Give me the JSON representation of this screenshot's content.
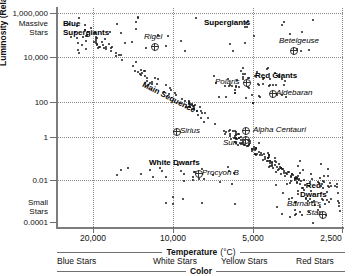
{
  "chart_data": {
    "type": "scatter",
    "title": "",
    "xlabel": "Temperature (°C)",
    "ylabel": "Luminosity (Relative to the Sun)",
    "x_scale": "log-reversed",
    "y_scale": "log",
    "xticks": [
      "20,000",
      "10,000",
      "5,000",
      "2,500"
    ],
    "xtick_values": [
      20000,
      10000,
      5000,
      2500
    ],
    "yticks": [
      "1,000,000",
      "10,000",
      "100",
      "1",
      "0.01",
      "0.0001"
    ],
    "ytick_values": [
      1000000,
      10000,
      100,
      1,
      0.01,
      0.0001
    ],
    "grid": "dotted",
    "y_extreme_top_note": "Massive Stars",
    "y_extreme_bottom_note": "Small Stars",
    "color_axis_label": "Color",
    "color_categories": [
      "Blue Stars",
      "White Stars",
      "Yellow Stars",
      "Red Stars"
    ],
    "region_labels": [
      {
        "name": "blue-supergiants",
        "text": "Blue\nSupergiants"
      },
      {
        "name": "supergiants",
        "text": "Supergiants"
      },
      {
        "name": "main-sequence",
        "text": "Main Sequence"
      },
      {
        "name": "red-giants",
        "text": "Red Giants"
      },
      {
        "name": "white-dwarfs",
        "text": "White Dwarfs"
      },
      {
        "name": "red-dwarfs",
        "text": "Red\nDwarfs"
      }
    ],
    "named_stars": [
      {
        "name": "Rigel",
        "temperature": 11000,
        "luminosity": 40000
      },
      {
        "name": "Betelgeuse",
        "temperature": 3400,
        "luminosity": 12000
      },
      {
        "name": "Polaris",
        "temperature": 6000,
        "luminosity": 2200
      },
      {
        "name": "Aldebaran",
        "temperature": 3900,
        "luminosity": 400
      },
      {
        "name": "Sirius",
        "temperature": 9900,
        "luminosity": 25
      },
      {
        "name": "Alpha Centauri",
        "temperature": 5500,
        "luminosity": 1.5
      },
      {
        "name": "Sun",
        "temperature": 5500,
        "luminosity": 1
      },
      {
        "name": "Procyon B",
        "temperature": 7700,
        "luminosity": 0.05
      },
      {
        "name": "Barnard's\nStar",
        "temperature": 3100,
        "luminosity": 0.004
      }
    ]
  },
  "axes": {
    "y": {
      "title": "Luminosity (Relative to the Sun)",
      "top_note": "Massive\nStars",
      "bottom_note": "Small\nStars",
      "ticks": [
        {
          "label": "1,000,000"
        },
        {
          "label": "10,000"
        },
        {
          "label": "100"
        },
        {
          "label": "1"
        },
        {
          "label": "0.01"
        },
        {
          "label": "0.0001"
        }
      ]
    },
    "x": {
      "title": "Temperature",
      "unit": "(°C)",
      "ticks": [
        {
          "label": "20,000"
        },
        {
          "label": "10,000"
        },
        {
          "label": "5,000"
        },
        {
          "label": "2,500"
        }
      ]
    },
    "color": {
      "title": "Color",
      "categories": [
        {
          "label": "Blue Stars"
        },
        {
          "label": "White Stars"
        },
        {
          "label": "Yellow Stars"
        },
        {
          "label": "Red Stars"
        }
      ]
    }
  },
  "regions": {
    "blue_supergiants_l1": "Blue",
    "blue_supergiants_l2": "Supergiants",
    "supergiants": "Supergiants",
    "main_sequence": "Main Sequence",
    "red_giants": "Red Giants",
    "white_dwarfs": "White Dwarfs",
    "red_dwarfs_l1": "Red",
    "red_dwarfs_l2": "Dwarfs"
  },
  "stars": {
    "rigel": "Rigel",
    "betelgeuse": "Betelgeuse",
    "polaris": "Polaris",
    "aldebaran": "Aldebaran",
    "sirius": "Sirius",
    "alpha_centauri": "Alpha Centauri",
    "sun": "Sun",
    "procyon_b": "Procyon B",
    "barnards_star_l1": "Barnard's",
    "barnards_star_l2": "Star"
  },
  "colors": {
    "dot": "#1a1a1a",
    "grid": "#8a8a8a",
    "axis": "#7d7d7d",
    "text": "#111111"
  }
}
